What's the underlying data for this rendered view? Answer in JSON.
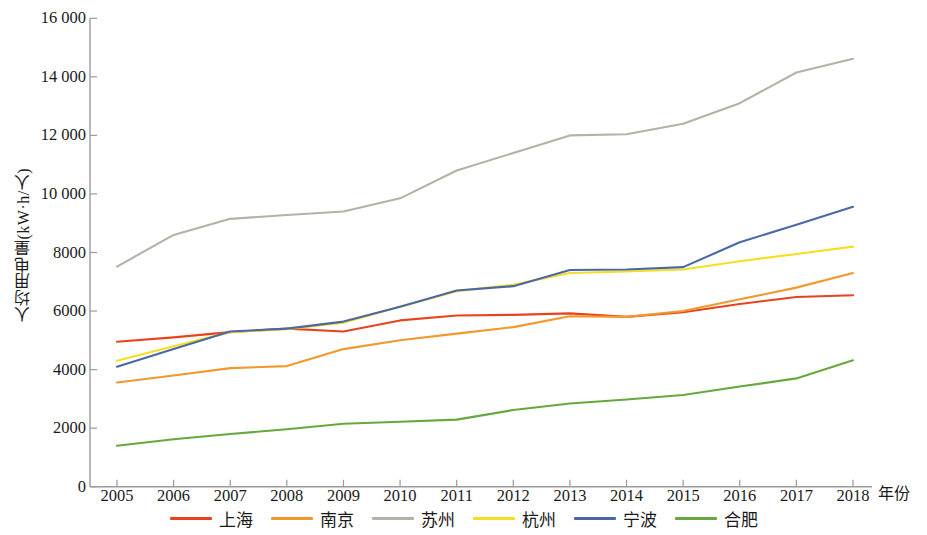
{
  "chart_data": {
    "type": "line",
    "title": "",
    "xlabel": "年份",
    "ylabel": "人均用电量(kW·h/人)",
    "categories": [
      2005,
      2006,
      2007,
      2008,
      2009,
      2010,
      2011,
      2012,
      2013,
      2014,
      2015,
      2016,
      2017,
      2018
    ],
    "x": [
      2005,
      2006,
      2007,
      2008,
      2009,
      2010,
      2011,
      2012,
      2013,
      2014,
      2015,
      2016,
      2017,
      2018
    ],
    "xlim": [
      2005,
      2018
    ],
    "ylim": [
      0,
      16000
    ],
    "yticks": [
      0,
      2000,
      4000,
      6000,
      8000,
      10000,
      12000,
      14000,
      16000
    ],
    "ytick_labels": [
      "0",
      "2000",
      "4000",
      "6000",
      "8000",
      "10 000",
      "12 000",
      "14 000",
      "16 000"
    ],
    "xtick_labels": [
      "2005",
      "2006",
      "2007",
      "2008",
      "2009",
      "2010",
      "2011",
      "2012",
      "2013",
      "2014",
      "2015",
      "2016",
      "2017",
      "2018"
    ],
    "grid": false,
    "legend_position": "bottom",
    "series": [
      {
        "name": "上海",
        "color": "#E8431F",
        "values": [
          4950,
          5100,
          5280,
          5400,
          5300,
          5680,
          5850,
          5870,
          5920,
          5800,
          5960,
          6240,
          6480,
          6540
        ]
      },
      {
        "name": "南京",
        "color": "#F2982C",
        "values": [
          3560,
          3800,
          4050,
          4120,
          4700,
          5000,
          5230,
          5450,
          5820,
          5800,
          6000,
          6400,
          6800,
          7300
        ]
      },
      {
        "name": "苏州",
        "color": "#B4B1A6",
        "values": [
          7520,
          8600,
          9150,
          9280,
          9400,
          9850,
          10800,
          11400,
          12000,
          12040,
          12400,
          13100,
          14150,
          14620
        ]
      },
      {
        "name": "杭州",
        "color": "#F4E020",
        "values": [
          4300,
          4800,
          5280,
          5380,
          5600,
          6150,
          6680,
          6900,
          7300,
          7350,
          7420,
          7700,
          7950,
          8200
        ]
      },
      {
        "name": "宁波",
        "color": "#4A67A8",
        "values": [
          4100,
          4700,
          5300,
          5400,
          5640,
          6150,
          6700,
          6850,
          7400,
          7420,
          7500,
          8350,
          8950,
          9560
        ]
      },
      {
        "name": "合肥",
        "color": "#67A83D",
        "values": [
          1400,
          1620,
          1800,
          1960,
          2150,
          2220,
          2290,
          2620,
          2840,
          2980,
          3130,
          3420,
          3700,
          4320
        ]
      }
    ]
  },
  "axes": {
    "y_title": "人均用电量(kW·h/人)",
    "x_title": "年份"
  }
}
